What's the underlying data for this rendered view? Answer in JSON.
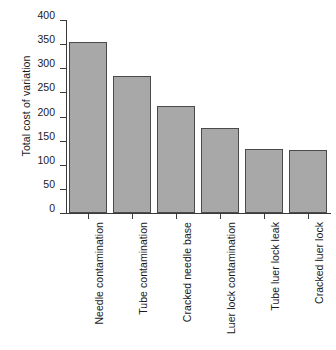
{
  "chart_data": {
    "type": "bar",
    "title": "",
    "subtitle": "",
    "xlabel": "",
    "ylabel": "Total cost of variation",
    "ylim": [
      0,
      400
    ],
    "yticks": [
      0,
      50,
      100,
      150,
      200,
      250,
      300,
      350,
      400
    ],
    "grid": false,
    "legend": null,
    "orientation": "vertical",
    "bar_color": "#a8a8a8",
    "bar_edge_color": "#4a4a4a",
    "categories": [
      "Needle contamination",
      "Tube contamination",
      "Cracked needle base",
      "Luer lock contamination",
      "Tube luer lock leak",
      "Cracked luer lock"
    ],
    "values": [
      355,
      283,
      221,
      176,
      132,
      130
    ],
    "category_label_rotation": 90,
    "annotations": []
  }
}
